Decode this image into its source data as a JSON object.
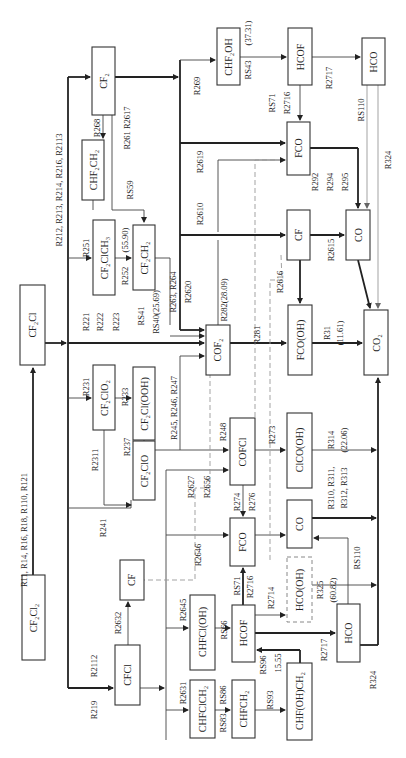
{
  "figure": {
    "orientation": "rotated 90deg counter-clockwise",
    "species": {
      "cf2cl2": "CF₂Cl₂",
      "cf2cl": "CF₂Cl",
      "cf2": "CF₂",
      "chf2ch2": "CHF₂CH₂",
      "cf2clch3": "CF₂ClCH₃",
      "cf2ch2": "CF₂CH₂",
      "cf2clo2": "CF₂ClO₂",
      "cf2clooh": "CF₂Cl(OOH)",
      "cf2clo": "CF₂ClO",
      "cf_left": "CF",
      "cfcl": "CFCl",
      "cof2": "COF₂",
      "chf2oh": "CHF₂OH",
      "hcof_top": "HCOF",
      "hco_top": "HCO",
      "fco_top": "FCO",
      "cf_mid": "CF",
      "co_top": "CO",
      "fcooh": "FCO(OH)",
      "co2": "CO₂",
      "cofcl": "COFCl",
      "fco_low": "FCO",
      "clcooh": "ClCO(OH)",
      "co_low": "CO",
      "hcooh": "HCO(OH)",
      "chfcloh": "CHFCl(OH)",
      "hcof_low": "HCOF",
      "hco_low": "HCO",
      "chfclch2": "CHFClCH₂",
      "chfch2": "CHFCH₂",
      "chfohch2": "CHF(OH)CH₂"
    },
    "reactions": {
      "r_cf2cl2_cf2cl": "R11, R14, R16, R18, R110, R121",
      "r_to_cf2": "R212, R213, R214, R216, R2113",
      "r268": "R268",
      "r261_r2617": "R261  R2617",
      "rs59": "RS59",
      "r251": "R251",
      "r252": "R252",
      "r252_val": "(55.90)",
      "r221": "R221",
      "r222": "R222",
      "r223": "R223",
      "rs41": "RS41",
      "rs40": "RS40(25.69)",
      "r263_r264": "R263, R264",
      "r2620": "R2620",
      "r282": "R282(28.09)",
      "r269": "R269",
      "rs43": "RS43",
      "rs43_val": "(37.31)",
      "r2610": "R2610",
      "r2619": "R2619",
      "r231": "R231",
      "r233": "R233",
      "r2311": "R2311",
      "r237": "R237",
      "r241": "R241",
      "r245": "R245, R246, R247",
      "r248": "R248",
      "r2627": "R2627",
      "r2656": "R2656",
      "r2646": "R2646",
      "r219": "R219",
      "r2112": "R2112",
      "r2632": "R2632",
      "r2645": "R2645",
      "r2631": "R2631",
      "rs66": "RS66",
      "rs83": "RS83",
      "rs86": "RS86",
      "rs93": "RS93",
      "rs96": "RS96",
      "rs96_val": "15.55",
      "rs71_low": "RS71",
      "r2716_low": "R2716",
      "r2714": "R2714",
      "r2717_low": "R2717",
      "r324_low": "R324",
      "r274": "R274",
      "r276": "R276",
      "r273": "R273",
      "r314": "R314",
      "r314_val": "(22.06)",
      "r310a": "R310, R311,",
      "r310b": "R312, R313",
      "rs110_low": "RS110",
      "r325": "R325",
      "r325_val": "(60.82)",
      "r281": "R281",
      "r31": "R31",
      "r31_val": "(11.61)",
      "r2616": "R2616",
      "r2615": "R2615",
      "rs71_top": "RS71",
      "r2716_top": "R2716",
      "r2717_top": "R2717",
      "rs110_top": "RS110",
      "r324_top": "R324",
      "r292": "R292",
      "r294": "R294",
      "r295": "R295"
    }
  }
}
